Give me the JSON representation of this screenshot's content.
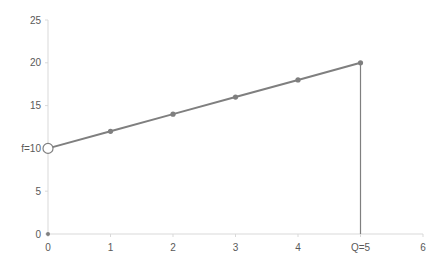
{
  "chart_data": {
    "type": "line",
    "title": "",
    "xlabel": "",
    "ylabel": "",
    "xlim": [
      0,
      6
    ],
    "ylim": [
      0,
      25
    ],
    "grid": false,
    "legend": null,
    "x_ticks": [
      {
        "value": 0,
        "label": "0"
      },
      {
        "value": 1,
        "label": "1"
      },
      {
        "value": 2,
        "label": "2"
      },
      {
        "value": 3,
        "label": "3"
      },
      {
        "value": 4,
        "label": "4"
      },
      {
        "value": 5,
        "label": "Q=5"
      },
      {
        "value": 6,
        "label": "6"
      }
    ],
    "y_ticks": [
      {
        "value": 0,
        "label": "0"
      },
      {
        "value": 5,
        "label": "5"
      },
      {
        "value": 10,
        "label": "f=10"
      },
      {
        "value": 15,
        "label": "15"
      },
      {
        "value": 20,
        "label": "20"
      },
      {
        "value": 25,
        "label": "25"
      }
    ],
    "series": [
      {
        "name": "cost line",
        "x": [
          0,
          1,
          2,
          3,
          4,
          5
        ],
        "y": [
          10,
          12,
          14,
          16,
          18,
          20
        ],
        "color": "#7f7f7f",
        "open_marker_at": [
          0,
          10
        ]
      },
      {
        "name": "vertical drop at Q",
        "x": [
          5,
          5
        ],
        "y": [
          20,
          0
        ],
        "color": "#7f7f7f"
      },
      {
        "name": "origin point",
        "x": [
          0
        ],
        "y": [
          0
        ],
        "color": "#7f7f7f"
      }
    ],
    "annotations": [
      {
        "text": "f=10",
        "at": [
          0,
          10
        ]
      },
      {
        "text": "Q=5",
        "at": [
          5,
          0
        ]
      }
    ]
  },
  "colors": {
    "axis": "#d9d9d9",
    "line": "#7f7f7f",
    "text": "#595959"
  }
}
